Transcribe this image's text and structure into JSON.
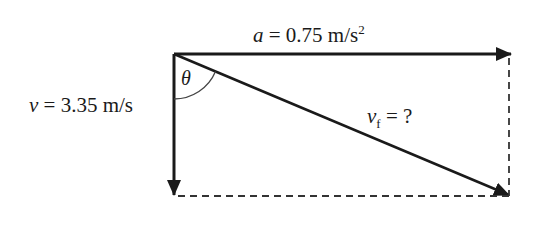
{
  "diagram": {
    "type": "vector-triangle",
    "labels": {
      "acceleration": {
        "symbol": "a",
        "equals": " = 0.75 m/s",
        "sup": "2"
      },
      "velocity": {
        "symbol": "v",
        "equals": " = 3.35 m/s"
      },
      "final_velocity": {
        "symbol": "v",
        "sub": "f",
        "equals": " = ?"
      },
      "angle": {
        "symbol": "θ"
      }
    },
    "colors": {
      "line": "#1a1a1a",
      "background": "#ffffff"
    }
  }
}
